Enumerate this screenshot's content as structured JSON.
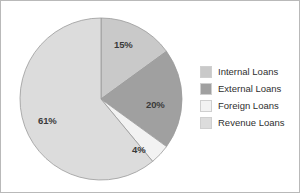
{
  "chart_data": {
    "type": "pie",
    "title": "",
    "categories": [
      "Internal Loans",
      "External Loans",
      "Foreign Loans",
      "Revenue Loans"
    ],
    "values": [
      15,
      20,
      4,
      61
    ],
    "value_labels": [
      "15%",
      "20%",
      "4%",
      "61%"
    ],
    "colors": [
      "#c9c9c9",
      "#a0a0a0",
      "#f2f2f2",
      "#dcdcdc"
    ],
    "start_angle_deg": 0,
    "direction": "clockwise",
    "legend_position": "right",
    "grid": false,
    "unit": "%"
  },
  "legend": {
    "items": [
      {
        "label": "Internal Loans",
        "color": "#c9c9c9"
      },
      {
        "label": "External Loans",
        "color": "#a0a0a0"
      },
      {
        "label": "Foreign Loans",
        "color": "#f2f2f2"
      },
      {
        "label": "Revenue Loans",
        "color": "#dcdcdc"
      }
    ]
  },
  "pie": {
    "labels": {
      "internal": "15%",
      "external": "20%",
      "foreign": "4%",
      "revenue": "61%"
    },
    "geometry": {
      "center_x": 100,
      "center_y": 98,
      "radius": 81
    },
    "stroke_color": "#9a9a9a"
  }
}
